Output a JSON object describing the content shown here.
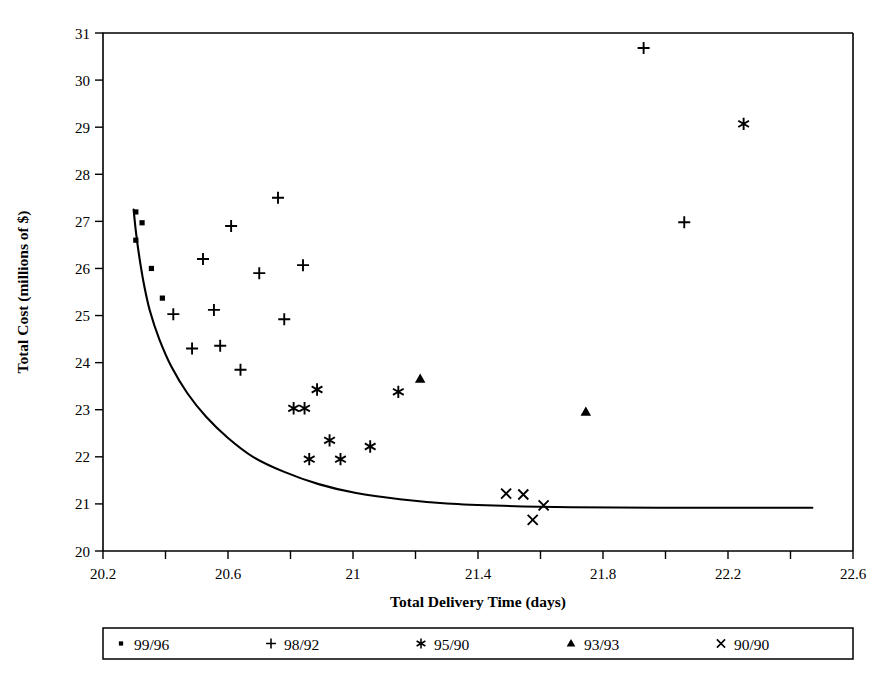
{
  "chart_data": {
    "type": "scatter",
    "title": "",
    "xlabel": "Total Delivery Time (days)",
    "ylabel": "Total Cost (millions of $)",
    "xlim": [
      20.2,
      22.6
    ],
    "ylim": [
      20,
      31
    ],
    "xticks": [
      20.2,
      20.4,
      20.6,
      20.8,
      21,
      21.2,
      21.4,
      21.6,
      21.8,
      22,
      22.2,
      22.4,
      22.6
    ],
    "xtick_labels": [
      "20.2",
      "",
      "20.6",
      "",
      "21",
      "",
      "21.4",
      "",
      "21.8",
      "",
      "22.2",
      "",
      "22.6"
    ],
    "yticks": [
      20,
      21,
      22,
      23,
      24,
      25,
      26,
      27,
      28,
      29,
      30,
      31
    ],
    "ytick_labels": [
      "20",
      "21",
      "22",
      "23",
      "24",
      "25",
      "26",
      "27",
      "28",
      "29",
      "30",
      "31"
    ],
    "grid": false,
    "legend_position": "bottom",
    "series": [
      {
        "name": "99/96",
        "marker": "square",
        "points": [
          [
            20.305,
            27.2
          ],
          [
            20.325,
            26.97
          ],
          [
            20.305,
            26.6
          ],
          [
            20.355,
            26.0
          ],
          [
            20.39,
            25.37
          ]
        ]
      },
      {
        "name": "98/92",
        "marker": "plus",
        "points": [
          [
            20.425,
            25.03
          ],
          [
            20.485,
            24.3
          ],
          [
            20.52,
            26.2
          ],
          [
            20.555,
            25.12
          ],
          [
            20.575,
            24.36
          ],
          [
            20.61,
            26.9
          ],
          [
            20.64,
            23.85
          ],
          [
            20.7,
            25.9
          ],
          [
            20.76,
            27.5
          ],
          [
            20.78,
            24.92
          ],
          [
            20.84,
            26.07
          ],
          [
            21.93,
            30.68
          ],
          [
            22.06,
            26.98
          ]
        ]
      },
      {
        "name": "95/90",
        "marker": "asterisk",
        "points": [
          [
            20.81,
            23.03
          ],
          [
            20.845,
            23.03
          ],
          [
            20.86,
            21.95
          ],
          [
            20.885,
            23.43
          ],
          [
            20.925,
            22.35
          ],
          [
            20.96,
            21.95
          ],
          [
            21.055,
            22.22
          ],
          [
            21.145,
            23.38
          ],
          [
            22.25,
            29.07
          ]
        ]
      },
      {
        "name": "93/93",
        "marker": "triangle",
        "points": [
          [
            21.215,
            23.65
          ],
          [
            21.745,
            22.95
          ]
        ]
      },
      {
        "name": "90/90",
        "marker": "cross",
        "points": [
          [
            21.49,
            21.22
          ],
          [
            21.545,
            21.2
          ],
          [
            21.575,
            20.66
          ],
          [
            21.61,
            20.97
          ]
        ]
      }
    ],
    "fitted_curve": {
      "description": "efficient-frontier style decreasing convex curve approaching asymptote near 20.92",
      "points": [
        [
          20.298,
          27.25
        ],
        [
          20.305,
          26.8
        ],
        [
          20.315,
          26.3
        ],
        [
          20.33,
          25.7
        ],
        [
          20.35,
          25.1
        ],
        [
          20.38,
          24.5
        ],
        [
          20.42,
          23.9
        ],
        [
          20.47,
          23.35
        ],
        [
          20.53,
          22.85
        ],
        [
          20.6,
          22.4
        ],
        [
          20.68,
          22.0
        ],
        [
          20.78,
          21.68
        ],
        [
          20.89,
          21.42
        ],
        [
          21.01,
          21.23
        ],
        [
          21.15,
          21.1
        ],
        [
          21.3,
          21.01
        ],
        [
          21.48,
          20.96
        ],
        [
          21.7,
          20.93
        ],
        [
          21.98,
          20.92
        ],
        [
          22.3,
          20.92
        ],
        [
          22.47,
          20.92
        ]
      ]
    }
  },
  "legend": {
    "items": [
      {
        "label": "99/96",
        "marker": "square-marker"
      },
      {
        "label": "98/92",
        "marker": "plus-marker"
      },
      {
        "label": "95/90",
        "marker": "asterisk-marker"
      },
      {
        "label": "93/93",
        "marker": "triangle-marker"
      },
      {
        "label": "90/90",
        "marker": "cross-marker"
      }
    ]
  },
  "colors": {
    "foreground": "#000000",
    "background": "#ffffff"
  }
}
